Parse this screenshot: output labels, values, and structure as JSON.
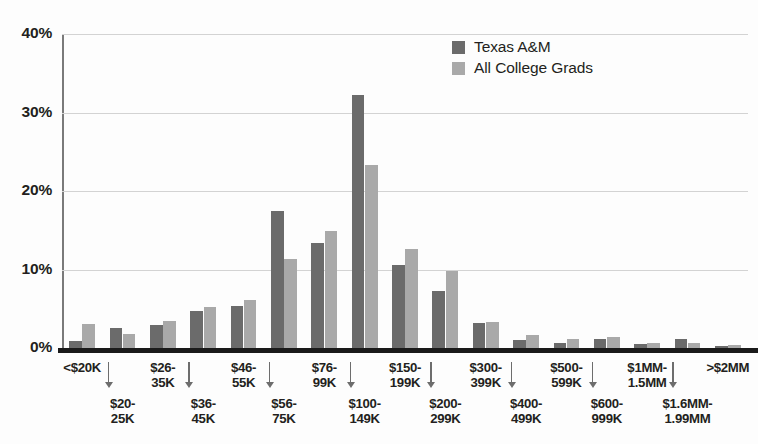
{
  "legend": {
    "position": "top-center-right",
    "items": [
      {
        "label": "Texas A&M",
        "color": "#6b6b6b"
      },
      {
        "label": "All College Grads",
        "color": "#a9a9a9"
      }
    ]
  },
  "axis": {
    "y_ticks": [
      "0%",
      "10%",
      "20%",
      "30%",
      "40%"
    ]
  },
  "chart_data": {
    "type": "bar",
    "title": "",
    "subtitle": "",
    "xlabel": "",
    "ylabel": "",
    "ylim": [
      0,
      40
    ],
    "y_ticks": [
      0,
      10,
      20,
      30,
      40
    ],
    "y_tick_labels": [
      "0%",
      "10%",
      "20%",
      "30%",
      "40%"
    ],
    "grid": true,
    "legend_position": "top-center-right",
    "categories": [
      "<$20K",
      "$20-25K",
      "$26-35K",
      "$36-45K",
      "$46-55K",
      "$56-75K",
      "$76-99K",
      "$100-149K",
      "$150-199K",
      "$200-299K",
      "$300-399K",
      "$400-499K",
      "$500-599K",
      "$600-999K",
      "$1MM-1.5MM",
      "$1.6MM-1.99MM",
      ">$2MM"
    ],
    "series": [
      {
        "name": "Texas A&M",
        "color": "#6b6b6b",
        "values": [
          0.9,
          2.6,
          2.9,
          4.7,
          5.3,
          17.4,
          13.4,
          32.2,
          10.6,
          7.2,
          3.2,
          1.0,
          0.6,
          1.1,
          0.5,
          1.1,
          0.2
        ]
      },
      {
        "name": "All College Grads",
        "color": "#a9a9a9",
        "values": [
          3.1,
          1.8,
          3.5,
          5.2,
          6.1,
          11.4,
          14.9,
          23.3,
          12.6,
          9.8,
          3.3,
          1.7,
          1.1,
          1.4,
          0.7,
          0.6,
          0.4
        ]
      }
    ]
  },
  "xaxis_labels": [
    {
      "text": "<$20K",
      "row": "top"
    },
    {
      "text": "$20-\n25K",
      "row": "bottom"
    },
    {
      "text": "$26-\n35K",
      "row": "top"
    },
    {
      "text": "$36-\n45K",
      "row": "bottom"
    },
    {
      "text": "$46-\n55K",
      "row": "top"
    },
    {
      "text": "$56-\n75K",
      "row": "bottom"
    },
    {
      "text": "$76-\n99K",
      "row": "top"
    },
    {
      "text": "$100-\n149K",
      "row": "bottom"
    },
    {
      "text": "$150-\n199K",
      "row": "top"
    },
    {
      "text": "$200-\n299K",
      "row": "bottom"
    },
    {
      "text": "$300-\n399K",
      "row": "top"
    },
    {
      "text": "$400-\n499K",
      "row": "bottom"
    },
    {
      "text": "$500-\n599K",
      "row": "top"
    },
    {
      "text": "$600-\n999K",
      "row": "bottom"
    },
    {
      "text": "$1MM-\n1.5MM",
      "row": "top"
    },
    {
      "text": "$1.6MM-\n1.99MM",
      "row": "bottom"
    },
    {
      "text": ">$2MM",
      "row": "top"
    }
  ]
}
